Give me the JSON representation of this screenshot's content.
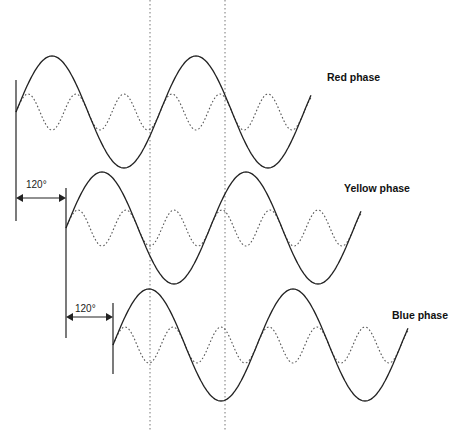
{
  "diagram": {
    "phases": [
      {
        "name": "Red phase",
        "start_x": 16,
        "mid_y": 112,
        "label_x": 328,
        "label_y": 71
      },
      {
        "name": "Yellow phase",
        "start_x": 66,
        "mid_y": 228,
        "label_x": 344,
        "label_y": 182
      },
      {
        "name": "Blue phase",
        "start_x": 113,
        "mid_y": 345,
        "label_x": 392,
        "label_y": 309
      }
    ],
    "displacement_labels": [
      "120°",
      "120°"
    ],
    "fundamental_amplitude": 56,
    "harmonic_amplitude": 18,
    "period_px": 144,
    "cycles": 2.05,
    "line_color": "#222222",
    "reference_lines_x": [
      150,
      225
    ]
  }
}
